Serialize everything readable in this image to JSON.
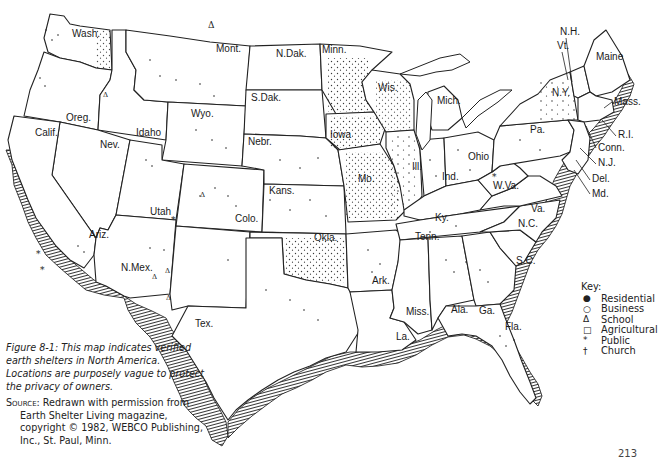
{
  "figure": {
    "caption": "Figure 8-1: This map indicates verified earth shelters in North America. Locations are purposely vague to protect the privacy of owners.",
    "source_label": "Source:",
    "source_text": "Redrawn with permission from Earth Shelter Living magazine, copyright © 1982, WEBCO Publishing, Inc., St. Paul, Minn.",
    "page_number": "213"
  },
  "key": {
    "title": "Key:",
    "items": [
      {
        "symbol": "●",
        "name": "residential",
        "label": "Residential"
      },
      {
        "symbol": "○",
        "name": "business",
        "label": "Business"
      },
      {
        "symbol": "Δ",
        "name": "school",
        "label": "School"
      },
      {
        "symbol": "□",
        "name": "agricultural",
        "label": "Agricultural"
      },
      {
        "symbol": "*",
        "name": "public",
        "label": "Public"
      },
      {
        "symbol": "†",
        "name": "church",
        "label": "Church"
      }
    ]
  },
  "states": [
    {
      "label": "Wash.",
      "x": 72,
      "y": 37
    },
    {
      "label": "Oreg.",
      "x": 66,
      "y": 121
    },
    {
      "label": "Calif.",
      "x": 35,
      "y": 136
    },
    {
      "label": "Idaho",
      "x": 136,
      "y": 136
    },
    {
      "label": "Nev.",
      "x": 100,
      "y": 148
    },
    {
      "label": "Mont.",
      "x": 216,
      "y": 52
    },
    {
      "label": "Wyo.",
      "x": 191,
      "y": 117
    },
    {
      "label": "Utah",
      "x": 150,
      "y": 215
    },
    {
      "label": "Ariz.",
      "x": 89,
      "y": 238
    },
    {
      "label": "Colo.",
      "x": 235,
      "y": 222
    },
    {
      "label": "N.Mex.",
      "x": 121,
      "y": 271
    },
    {
      "label": "N.Dak.",
      "x": 276,
      "y": 57
    },
    {
      "label": "S.Dak.",
      "x": 251,
      "y": 101
    },
    {
      "label": "Nebr.",
      "x": 248,
      "y": 145
    },
    {
      "label": "Kans.",
      "x": 269,
      "y": 194
    },
    {
      "label": "Okla.",
      "x": 314,
      "y": 241
    },
    {
      "label": "Tex.",
      "x": 195,
      "y": 327
    },
    {
      "label": "Minn.",
      "x": 322,
      "y": 53
    },
    {
      "label": "Iowa",
      "x": 330,
      "y": 138
    },
    {
      "label": "Mo.",
      "x": 358,
      "y": 182
    },
    {
      "label": "Ark.",
      "x": 372,
      "y": 284
    },
    {
      "label": "La.",
      "x": 396,
      "y": 340
    },
    {
      "label": "Wis.",
      "x": 378,
      "y": 91
    },
    {
      "label": "Ill.",
      "x": 412,
      "y": 170
    },
    {
      "label": "Mich.",
      "x": 437,
      "y": 104
    },
    {
      "label": "Ind.",
      "x": 442,
      "y": 180
    },
    {
      "label": "Ohio",
      "x": 468,
      "y": 160
    },
    {
      "label": "Ky.",
      "x": 435,
      "y": 221
    },
    {
      "label": "Tenn.",
      "x": 415,
      "y": 240
    },
    {
      "label": "Miss.",
      "x": 406,
      "y": 315
    },
    {
      "label": "Ala.",
      "x": 451,
      "y": 313
    },
    {
      "label": "Ga.",
      "x": 479,
      "y": 314
    },
    {
      "label": "Fla.",
      "x": 505,
      "y": 330
    },
    {
      "label": "S.C.",
      "x": 516,
      "y": 264
    },
    {
      "label": "N.C.",
      "x": 518,
      "y": 227
    },
    {
      "label": "Va.",
      "x": 531,
      "y": 212
    },
    {
      "label": "W.Va.",
      "x": 493,
      "y": 189
    },
    {
      "label": "Pa.",
      "x": 530,
      "y": 133
    },
    {
      "label": "N.Y.",
      "x": 552,
      "y": 96
    },
    {
      "label": "Vt.",
      "x": 557,
      "y": 49
    },
    {
      "label": "N.H.",
      "x": 560,
      "y": 35
    },
    {
      "label": "Maine",
      "x": 596,
      "y": 60
    },
    {
      "label": "Mass.",
      "x": 614,
      "y": 105
    },
    {
      "label": "R.I.",
      "x": 618,
      "y": 138
    },
    {
      "label": "Conn.",
      "x": 598,
      "y": 151
    },
    {
      "label": "N.J.",
      "x": 598,
      "y": 166
    },
    {
      "label": "Del.",
      "x": 592,
      "y": 182
    },
    {
      "label": "Md.",
      "x": 592,
      "y": 197
    }
  ]
}
